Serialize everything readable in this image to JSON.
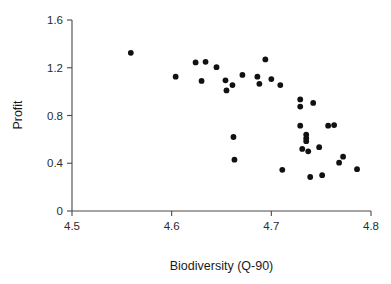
{
  "chart_data": {
    "type": "scatter",
    "title": "",
    "xlabel": "Biodiversity (Q-90)",
    "ylabel": "Profit",
    "xlim": [
      4.5,
      4.8
    ],
    "ylim": [
      0,
      1.6
    ],
    "xticks": [
      "4.5",
      "4.6",
      "4.7",
      "4.8"
    ],
    "xtick_values": [
      4.5,
      4.6,
      4.7,
      4.8
    ],
    "yticks": [
      "0",
      "0.4",
      "0.8",
      "1.2",
      "1.6"
    ],
    "ytick_values": [
      0,
      0.4,
      0.8,
      1.2,
      1.6
    ],
    "grid": false,
    "legend": null,
    "marker": "filled-circle",
    "marker_color": "#111111",
    "marker_size": 5,
    "points": [
      {
        "x": 4.559,
        "y": 1.325
      },
      {
        "x": 4.604,
        "y": 1.125
      },
      {
        "x": 4.624,
        "y": 1.245
      },
      {
        "x": 4.63,
        "y": 1.09
      },
      {
        "x": 4.634,
        "y": 1.25
      },
      {
        "x": 4.645,
        "y": 1.205
      },
      {
        "x": 4.654,
        "y": 1.095
      },
      {
        "x": 4.655,
        "y": 1.01
      },
      {
        "x": 4.661,
        "y": 1.055
      },
      {
        "x": 4.662,
        "y": 0.62
      },
      {
        "x": 4.663,
        "y": 0.43
      },
      {
        "x": 4.671,
        "y": 1.14
      },
      {
        "x": 4.686,
        "y": 1.125
      },
      {
        "x": 4.688,
        "y": 1.065
      },
      {
        "x": 4.694,
        "y": 1.27
      },
      {
        "x": 4.7,
        "y": 1.105
      },
      {
        "x": 4.709,
        "y": 1.055
      },
      {
        "x": 4.711,
        "y": 0.345
      },
      {
        "x": 4.729,
        "y": 0.935
      },
      {
        "x": 4.729,
        "y": 0.875
      },
      {
        "x": 4.729,
        "y": 0.715
      },
      {
        "x": 4.731,
        "y": 0.52
      },
      {
        "x": 4.735,
        "y": 0.64
      },
      {
        "x": 4.735,
        "y": 0.61
      },
      {
        "x": 4.735,
        "y": 0.585
      },
      {
        "x": 4.737,
        "y": 0.5
      },
      {
        "x": 4.739,
        "y": 0.285
      },
      {
        "x": 4.742,
        "y": 0.905
      },
      {
        "x": 4.748,
        "y": 0.535
      },
      {
        "x": 4.751,
        "y": 0.3
      },
      {
        "x": 4.757,
        "y": 0.715
      },
      {
        "x": 4.763,
        "y": 0.72
      },
      {
        "x": 4.768,
        "y": 0.405
      },
      {
        "x": 4.772,
        "y": 0.455
      },
      {
        "x": 4.786,
        "y": 0.35
      }
    ]
  }
}
